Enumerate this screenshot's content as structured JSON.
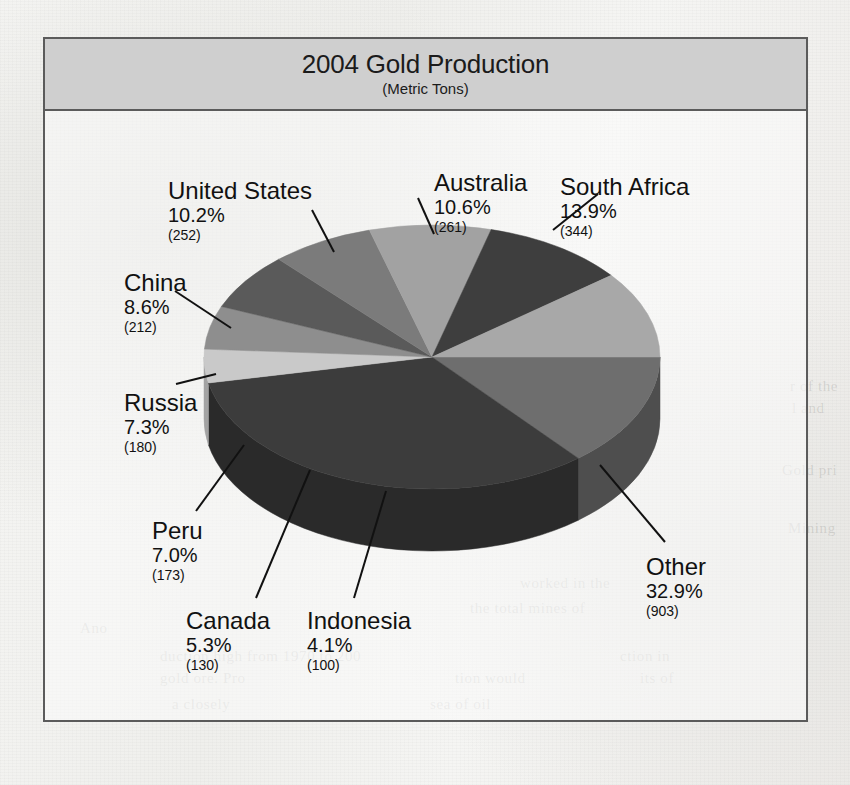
{
  "figure": {
    "title": "2004 Gold Production",
    "subtitle": "(Metric Tons)"
  },
  "background_text": [
    {
      "text": "r of the",
      "x": 790,
      "y": 378
    },
    {
      "text": "l and",
      "x": 792,
      "y": 400
    },
    {
      "text": "Gold pri",
      "x": 782,
      "y": 462
    },
    {
      "text": "Mining",
      "x": 788,
      "y": 520
    },
    {
      "text": "worked in the",
      "x": 520,
      "y": 575
    },
    {
      "text": "the total mines of",
      "x": 470,
      "y": 600
    },
    {
      "text": "Ano",
      "x": 80,
      "y": 620
    },
    {
      "text": "duction high from 1970 to 200",
      "x": 160,
      "y": 648
    },
    {
      "text": "gold ore. Pro",
      "x": 160,
      "y": 670
    },
    {
      "text": "tion would",
      "x": 455,
      "y": 670
    },
    {
      "text": "a closely",
      "x": 172,
      "y": 696
    },
    {
      "text": "sea of oil",
      "x": 430,
      "y": 696
    },
    {
      "text": "ction in",
      "x": 620,
      "y": 648
    },
    {
      "text": "its of",
      "x": 640,
      "y": 670
    }
  ],
  "chart_data": {
    "type": "pie",
    "title": "2004 Gold Production",
    "subtitle": "(Metric Tons)",
    "unit": "Metric Tons",
    "total": 2555,
    "legend": "labels-with-leader-lines",
    "grid": false,
    "categories": [
      "South Africa",
      "Other",
      "Indonesia",
      "Canada",
      "Peru",
      "Russia",
      "China",
      "United States",
      "Australia"
    ],
    "values": [
      344,
      903,
      100,
      130,
      173,
      180,
      212,
      252,
      261
    ],
    "percents": [
      13.9,
      32.9,
      4.1,
      5.3,
      7.0,
      7.3,
      8.6,
      10.2,
      10.6
    ],
    "slices": [
      {
        "name": "South Africa",
        "percent": "13.9%",
        "value": "(344)",
        "value_num": 344,
        "percent_num": 13.9,
        "top_color": "#6e6e6e",
        "side_color": "#4e4e4e",
        "label": {
          "x": 560,
          "y": 172,
          "align": "left"
        },
        "leader": {
          "x1": 553,
          "y1": 228,
          "x2": 598,
          "y2": 192
        }
      },
      {
        "name": "Other",
        "percent": "32.9%",
        "value": "(903)",
        "value_num": 903,
        "percent_num": 32.9,
        "top_color": "#3c3c3c",
        "side_color": "#2a2a2a",
        "label": {
          "x": 646,
          "y": 552,
          "align": "left"
        },
        "leader": {
          "x1": 600,
          "y1": 463,
          "x2": 665,
          "y2": 540
        }
      },
      {
        "name": "Indonesia",
        "percent": "4.1%",
        "value": "(100)",
        "value_num": 100,
        "percent_num": 4.1,
        "top_color": "#c9c9c9",
        "side_color": "#a3a3a3",
        "label": {
          "x": 307,
          "y": 606,
          "align": "left"
        },
        "leader": {
          "x1": 386,
          "y1": 489,
          "x2": 354,
          "y2": 596
        }
      },
      {
        "name": "Canada",
        "percent": "5.3%",
        "value": "(130)",
        "value_num": 130,
        "percent_num": 5.3,
        "top_color": "#8e8e8e",
        "side_color": "#6a6a6a",
        "label": {
          "x": 186,
          "y": 606,
          "align": "left"
        },
        "leader": {
          "x1": 310,
          "y1": 468,
          "x2": 256,
          "y2": 596
        }
      },
      {
        "name": "Peru",
        "percent": "7.0%",
        "value": "(173)",
        "value_num": 173,
        "percent_num": 7.0,
        "top_color": "#5a5a5a",
        "side_color": "#414141",
        "label": {
          "x": 152,
          "y": 516,
          "align": "left"
        },
        "leader": {
          "x1": 244,
          "y1": 443,
          "x2": 196,
          "y2": 509
        }
      },
      {
        "name": "Russia",
        "percent": "7.3%",
        "value": "(180)",
        "value_num": 180,
        "percent_num": 7.3,
        "top_color": "#7b7b7b",
        "side_color": "#585858",
        "label": {
          "x": 124,
          "y": 388,
          "align": "left"
        },
        "leader": {
          "x1": 216,
          "y1": 372,
          "x2": 176,
          "y2": 382
        }
      },
      {
        "name": "China",
        "percent": "8.6%",
        "value": "(212)",
        "value_num": 212,
        "percent_num": 8.6,
        "top_color": "#a2a2a2",
        "side_color": "#7c7c7c",
        "label": {
          "x": 124,
          "y": 268,
          "align": "left"
        },
        "leader": {
          "x1": 231,
          "y1": 326,
          "x2": 175,
          "y2": 289
        }
      },
      {
        "name": "United States",
        "percent": "10.2%",
        "value": "(252)",
        "value_num": 252,
        "percent_num": 10.2,
        "top_color": "#3e3e3e",
        "side_color": "#2c2c2c",
        "label": {
          "x": 168,
          "y": 176,
          "align": "left"
        },
        "leader": {
          "x1": 334,
          "y1": 250,
          "x2": 312,
          "y2": 208
        }
      },
      {
        "name": "Australia",
        "percent": "10.6%",
        "value": "(261)",
        "value_num": 261,
        "percent_num": 10.6,
        "top_color": "#a8a8a8",
        "side_color": "#828282",
        "label": {
          "x": 434,
          "y": 168,
          "align": "left"
        },
        "leader": {
          "x1": 434,
          "y1": 232,
          "x2": 418,
          "y2": 196
        }
      }
    ]
  }
}
